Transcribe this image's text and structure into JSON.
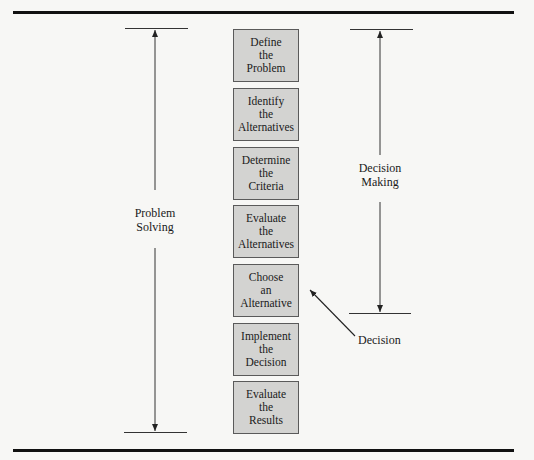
{
  "diagram": {
    "steps": [
      {
        "label": "Define\nthe\nProblem"
      },
      {
        "label": "Identify\nthe\nAlternatives"
      },
      {
        "label": "Determine\nthe\nCriteria"
      },
      {
        "label": "Evaluate\nthe\nAlternatives"
      },
      {
        "label": "Choose\nan\nAlternative"
      },
      {
        "label": "Implement\nthe\nDecision"
      },
      {
        "label": "Evaluate\nthe\nResults"
      }
    ],
    "spans": {
      "problem_solving": "Problem\nSolving",
      "decision_making": "Decision\nMaking"
    },
    "callout": "Decision",
    "colors": {
      "box_fill": "#d3d3d1",
      "box_border": "#5a5a5a",
      "line": "#333333",
      "background": "#f7f7f5"
    }
  }
}
